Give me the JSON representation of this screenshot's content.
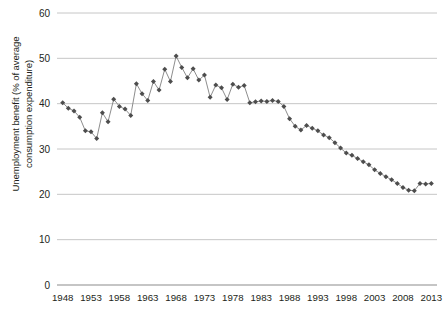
{
  "chart_data": {
    "type": "line",
    "title": "",
    "subtitle": "",
    "xlabel": "",
    "ylabel": "Unemployment benefit (% of average consumption expenditure)",
    "ylabel_line1": "Unemployment benefit (% of average",
    "ylabel_line2": "consumption expenditure)",
    "xlim": [
      1947.0,
      2014.0
    ],
    "ylim": [
      0,
      60
    ],
    "y_ticks": [
      0,
      10,
      20,
      30,
      40,
      50,
      60
    ],
    "y_tick_labels": [
      "0",
      "10",
      "20",
      "30",
      "40",
      "50",
      "60"
    ],
    "x_ticks": [
      1948,
      1953,
      1958,
      1963,
      1968,
      1973,
      1978,
      1983,
      1988,
      1993,
      1998,
      2003,
      2008,
      2013
    ],
    "x_tick_labels": [
      "1948",
      "1953",
      "1958",
      "1963",
      "1968",
      "1973",
      "1978",
      "1983",
      "1988",
      "1993",
      "1998",
      "2003",
      "2008",
      "2013"
    ],
    "grid": "horizontal",
    "legend": "none",
    "marker": "diamond",
    "marker_color": "#4d4d4d",
    "line_color": "#808080",
    "gridline_color": "#bfbfbf",
    "series": [
      {
        "name": "Unemployment benefit (% of average consumption expenditure)",
        "x": [
          1948,
          1949,
          1950,
          1951,
          1952,
          1953,
          1954,
          1955,
          1956,
          1957,
          1958,
          1959,
          1960,
          1961,
          1962,
          1963,
          1964,
          1965,
          1966,
          1967,
          1968,
          1969,
          1970,
          1971,
          1972,
          1973,
          1974,
          1975,
          1976,
          1977,
          1978,
          1979,
          1980,
          1981,
          1982,
          1983,
          1984,
          1985,
          1986,
          1987,
          1988,
          1989,
          1990,
          1991,
          1992,
          1993,
          1994,
          1995,
          1996,
          1997,
          1998,
          1999,
          2000,
          2001,
          2002,
          2003,
          2004,
          2005,
          2006,
          2007,
          2008,
          2009,
          2010,
          2011,
          2012,
          2013
        ],
        "values": [
          40.2,
          39.0,
          38.4,
          37.0,
          34.0,
          33.8,
          32.3,
          38.0,
          36.0,
          41.0,
          39.4,
          38.8,
          37.4,
          44.4,
          42.2,
          40.7,
          44.9,
          43.0,
          47.6,
          44.9,
          50.5,
          48.0,
          45.7,
          47.7,
          45.2,
          46.3,
          41.4,
          44.1,
          43.5,
          40.9,
          44.3,
          43.6,
          44.0,
          40.2,
          40.4,
          40.6,
          40.5,
          40.7,
          40.5,
          39.4,
          36.7,
          35.0,
          34.2,
          35.2,
          34.6,
          34.0,
          33.1,
          32.5,
          31.4,
          30.2,
          29.1,
          28.6,
          27.9,
          27.2,
          26.5,
          25.4,
          24.6,
          23.9,
          23.2,
          22.4,
          21.5,
          20.9,
          20.8,
          22.4,
          22.3,
          22.4
        ]
      }
    ]
  },
  "axes": {
    "y_axis_title_name": "y-axis-title",
    "x_axis_name": "x-axis"
  }
}
